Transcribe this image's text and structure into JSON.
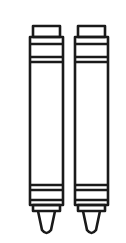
{
  "image": {
    "description": "Line-art illustration of two crayons side by side",
    "stroke_color": "#1a1a1a",
    "background_color": "#ffffff",
    "items": [
      {
        "name": "left-crayon",
        "x": 29
      },
      {
        "name": "right-crayon",
        "x": 75
      }
    ]
  }
}
